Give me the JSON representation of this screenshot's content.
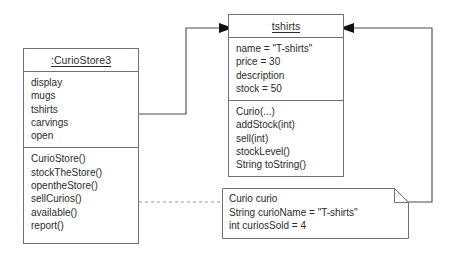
{
  "diagram": {
    "type": "uml-object-diagram",
    "stroke_color": "#6f7377",
    "text_color": "#2b2b2b",
    "dashed_link_color": "#9a9a9a"
  },
  "curiostore_object": {
    "title": ":CurioStore3",
    "attributes": [
      "display",
      "mugs",
      "tshirts",
      "carvings",
      "open"
    ],
    "operations": [
      "CurioStore()",
      "stockTheStore()",
      "opentheStore()",
      "sellCurios()",
      "available()",
      "report()"
    ]
  },
  "tshirts_object": {
    "title": "tshirts",
    "attributes": [
      "name = \"T-shirts\"",
      "price = 30",
      "description",
      "stock = 50"
    ],
    "operations": [
      "Curio(...)",
      "addStock(int)",
      "sell(int)",
      "stockLevel()",
      "String toString()"
    ]
  },
  "note": {
    "lines": [
      "Curio curio",
      "String curioName = \"T-shirts\"",
      "int curiosSold = 4"
    ]
  }
}
